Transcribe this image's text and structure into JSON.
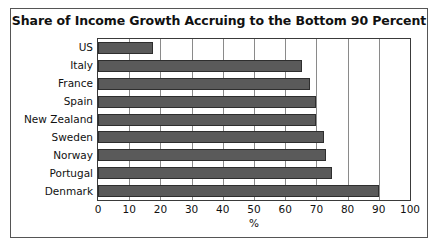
{
  "chart_data": {
    "type": "bar",
    "orientation": "horizontal",
    "title": "Share of Income Growth Accruing to the Bottom 90 Percent",
    "xlabel": "%",
    "ylabel": "",
    "xlim": [
      0,
      100
    ],
    "xticks": [
      0,
      10,
      20,
      30,
      40,
      50,
      60,
      70,
      80,
      90,
      100
    ],
    "grid": "vertical",
    "legend": "none",
    "bar_color": "#5a5a5a",
    "bar_edge_color": "#2e2e2e",
    "categories": [
      "US",
      "Italy",
      "France",
      "Spain",
      "New Zealand",
      "Sweden",
      "Norway",
      "Portugal",
      "Denmark"
    ],
    "values": [
      17.5,
      65.5,
      68,
      70,
      70,
      72.5,
      73,
      75,
      90
    ]
  },
  "figure": {
    "frame_color": "#555555",
    "background": "#ffffff"
  }
}
